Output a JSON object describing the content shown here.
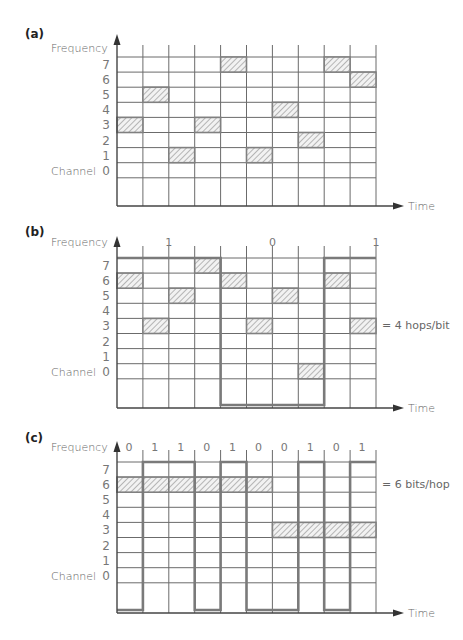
{
  "colors": {
    "grid": "#6b6b6b",
    "signal": "#7a7a7a",
    "hatch_border": "#808080",
    "hatch_fill": "#f2f2f2",
    "hatch_line": "#8c8c8c",
    "text": "#666666",
    "panel_label": "#222222"
  },
  "labels": {
    "frequency": "Frequency",
    "channel": "Channel",
    "time": "Time",
    "channels": [
      "7",
      "6",
      "5",
      "4",
      "3",
      "2",
      "1",
      "0"
    ]
  },
  "panels": [
    {
      "id": "a",
      "label": "(a)",
      "hops": [
        3,
        5,
        1,
        3,
        7,
        1,
        4,
        2,
        7,
        6
      ],
      "bits": [],
      "bit_labels": [],
      "note": ""
    },
    {
      "id": "b",
      "label": "(b)",
      "hops": [
        6,
        3,
        5,
        7,
        6,
        3,
        5,
        0,
        6,
        3
      ],
      "bits": [
        1,
        1,
        1,
        1,
        0,
        0,
        0,
        0,
        1,
        1
      ],
      "bit_labels": [
        {
          "text": "1",
          "at_column_edge": 2
        },
        {
          "text": "0",
          "at_column_edge": 6
        },
        {
          "text": "1",
          "at_column_edge": 10
        }
      ],
      "note": "= 4 hops/bit"
    },
    {
      "id": "c",
      "label": "(c)",
      "hop_spans": [
        {
          "channel": 6,
          "from": 0,
          "to": 6
        },
        {
          "channel": 3,
          "from": 6,
          "to": 10
        }
      ],
      "bits": [
        0,
        1,
        1,
        0,
        1,
        0,
        0,
        1,
        0,
        1
      ],
      "bit_labels_per_column": [
        "0",
        "1",
        "1",
        "0",
        "1",
        "0",
        "0",
        "1",
        "0",
        "1"
      ],
      "note": "= 6 bits/hop"
    }
  ]
}
